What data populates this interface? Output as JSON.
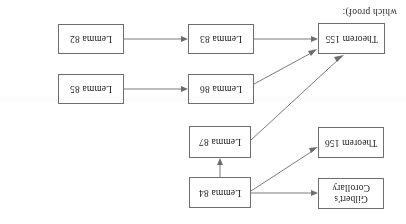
{
  "document": {
    "type": "proof-dependency-flowchart",
    "orientation_degrees": 180,
    "page_caption": "which proof):",
    "background_color": "#ffffff",
    "box_border_color": "#6e6e6e",
    "edge_color": "#7b7b7b",
    "text_color": "#1b1b1b"
  },
  "nodes": [
    {
      "id": "gilberts-corollary",
      "label": "Gilbert's\nCorollary",
      "x": 22,
      "y": 15,
      "w": 66,
      "h": 31
    },
    {
      "id": "lemma-84",
      "label": "Lemma 84",
      "x": 155,
      "y": 16,
      "w": 62,
      "h": 31
    },
    {
      "id": "theorem-156",
      "label": "Theorem 156",
      "x": 22,
      "y": 66,
      "w": 66,
      "h": 31
    },
    {
      "id": "lemma-87",
      "label": "Lemma 87",
      "x": 155,
      "y": 66,
      "w": 62,
      "h": 32
    },
    {
      "id": "lemma-86",
      "label": "Lemma 86",
      "x": 152,
      "y": 120,
      "w": 66,
      "h": 30
    },
    {
      "id": "lemma-85",
      "label": "Lemma 85",
      "x": 282,
      "y": 120,
      "w": 66,
      "h": 30
    },
    {
      "id": "theorem-155",
      "label": "Theorem 155",
      "x": 21,
      "y": 170,
      "w": 67,
      "h": 31
    },
    {
      "id": "lemma-83",
      "label": "Lemma 83",
      "x": 152,
      "y": 170,
      "w": 66,
      "h": 30
    },
    {
      "id": "lemma-82",
      "label": "Lemma 82",
      "x": 282,
      "y": 170,
      "w": 66,
      "h": 30
    }
  ],
  "edges": [
    {
      "from": "lemma-84",
      "to": "gilberts-corollary",
      "kind": "horizontal"
    },
    {
      "from": "lemma-84",
      "to": "theorem-156",
      "kind": "diagonal"
    },
    {
      "from": "lemma-84",
      "to": "lemma-87",
      "kind": "vertical"
    },
    {
      "from": "lemma-87",
      "to": "theorem-155",
      "kind": "diagonal"
    },
    {
      "from": "lemma-86",
      "to": "theorem-155",
      "kind": "diagonal"
    },
    {
      "from": "lemma-85",
      "to": "lemma-86",
      "kind": "horizontal"
    },
    {
      "from": "lemma-83",
      "to": "theorem-155",
      "kind": "horizontal"
    },
    {
      "from": "lemma-82",
      "to": "lemma-83",
      "kind": "horizontal"
    }
  ]
}
